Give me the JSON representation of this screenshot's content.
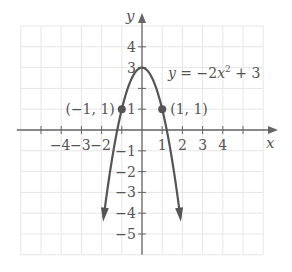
{
  "chart_data": {
    "type": "line",
    "title": "",
    "equation": "y = -2x^2 + 3",
    "equation_parts": {
      "lhs": "y = −2",
      "var": "x",
      "exp": "2",
      "rhs": " + 3"
    },
    "xlabel": "x",
    "ylabel": "y",
    "xlim": [
      -6,
      6
    ],
    "ylim": [
      -6,
      5
    ],
    "grid": true,
    "x_ticks": [
      -4,
      -3,
      -2,
      1,
      2,
      3,
      4
    ],
    "x_tick_labels": [
      "−4",
      "−3",
      "−2",
      "1",
      "2",
      "3",
      "4"
    ],
    "y_ticks": [
      4,
      3,
      1,
      -1,
      -2,
      -3,
      -4,
      -5
    ],
    "y_tick_labels": [
      "4",
      "3",
      "1",
      "−1",
      "−2",
      "−3",
      "−4",
      "−5"
    ],
    "series": [
      {
        "name": "y = -2x^2 + 3",
        "function": "-2*x*x+3",
        "x_range": [
          -1.9,
          1.9
        ],
        "color": "#555555",
        "arrows_at_ends": true
      }
    ],
    "points": [
      {
        "x": -1,
        "y": 1,
        "label": "(−1, 1)"
      },
      {
        "x": 1,
        "y": 1,
        "label": "(1, 1)"
      }
    ]
  },
  "colors": {
    "curve": "#555555",
    "axis": "#666666",
    "grid": "#e6e6e6",
    "text": "#555555"
  }
}
